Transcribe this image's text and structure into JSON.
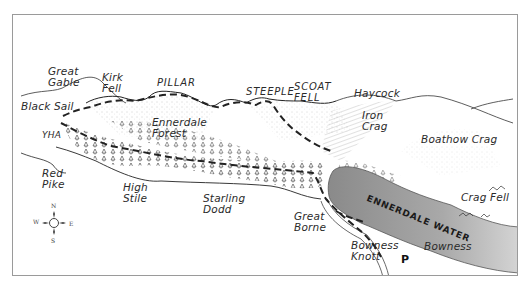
{
  "map": {
    "title": "Ennerdale",
    "colors": {
      "frame": "#9a9a9a",
      "lake": "#8f8f8f",
      "lake_light": "#bdbdbd",
      "route": "#222222",
      "ink": "#2a2a2a"
    },
    "labels": {
      "great_gable": "Great\nGable",
      "kirk_fell": "Kirk\nFell",
      "pillar": "PILLAR",
      "steeple": "STEEPLE",
      "scoat_fell": "SCOAT\nFELL",
      "haycock": "Haycock",
      "black_sail": "Black Sail",
      "yha": "YHA",
      "ennerdale_forest": "Ennerdale\nForest",
      "iron_crag": "Iron\nCrag",
      "boathow_crag": "Boathow Crag",
      "red_pike": "Red\nPike",
      "high_stile": "High\nStile",
      "starling_dodd": "Starling\nDodd",
      "great_borne": "Great\nBorne",
      "ennerdale_water": "ENNERDALE WATER",
      "crag_fell": "Crag Fell",
      "bowness_knott": "Bowness\nKnott",
      "bowness": "Bowness",
      "parking": "P"
    },
    "compass": {
      "n": "N",
      "s": "S",
      "e": "E",
      "w": "W"
    }
  }
}
